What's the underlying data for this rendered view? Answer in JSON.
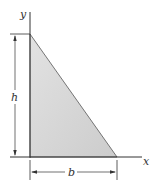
{
  "figure": {
    "type": "right-triangle-area",
    "labels": {
      "y_axis": "y",
      "x_axis": "x",
      "height": "h",
      "base": "b"
    },
    "colors": {
      "fill": "#d4d4d4",
      "stroke": "#333333",
      "background": "#ffffff"
    }
  }
}
